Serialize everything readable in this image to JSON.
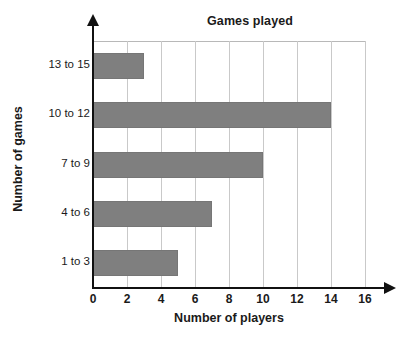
{
  "chart_data": {
    "type": "bar",
    "orientation": "horizontal",
    "title": "Games played",
    "xlabel": "Number of players",
    "ylabel": "Number of games",
    "categories": [
      "1 to 3",
      "4 to 6",
      "7 to 9",
      "10 to 12",
      "13 to 15"
    ],
    "values": [
      5,
      7,
      10,
      14,
      3
    ],
    "xlim": [
      0,
      16
    ],
    "xticks": [
      "0",
      "2",
      "4",
      "6",
      "8",
      "10",
      "12",
      "14",
      "16"
    ],
    "xtick_values": [
      0,
      2,
      4,
      6,
      8,
      10,
      12,
      14,
      16
    ],
    "grid": "vertical",
    "legend": "none",
    "bar_color": "#7f7f7f",
    "grid_color": "#c9c9c9",
    "axis_color": "#111111",
    "background_color": "#ffffff"
  }
}
